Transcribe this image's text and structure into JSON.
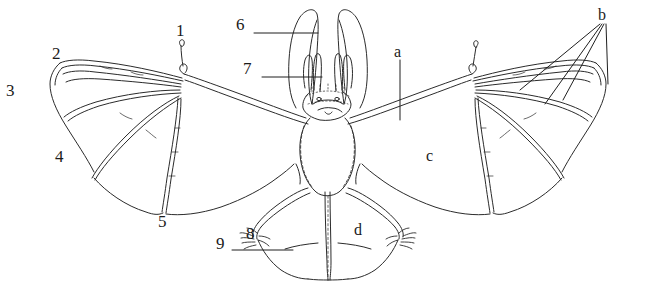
{
  "figure": {
    "background_color": "#ffffff",
    "ink_color": "#2b2b2b",
    "leader_color": "#1f1f1f"
  },
  "labels": {
    "n1": "1",
    "n2": "2",
    "n3": "3",
    "n4": "4",
    "n5": "5",
    "n6": "6",
    "n7": "7",
    "n8": "8",
    "n9": "9",
    "a": "a",
    "b": "b",
    "c": "c",
    "d": "d"
  },
  "label_positions": {
    "n1": {
      "x": 176,
      "y": 22
    },
    "n2": {
      "x": 52,
      "y": 45
    },
    "n3": {
      "x": 6,
      "y": 82
    },
    "n4": {
      "x": 55,
      "y": 148
    },
    "n5": {
      "x": 158,
      "y": 213
    },
    "n6": {
      "x": 236,
      "y": 16
    },
    "n7": {
      "x": 243,
      "y": 60
    },
    "n8": {
      "x": 246,
      "y": 225
    },
    "n9": {
      "x": 216,
      "y": 235
    },
    "a": {
      "x": 394,
      "y": 44
    },
    "b": {
      "x": 598,
      "y": 7
    },
    "c": {
      "x": 426,
      "y": 148
    },
    "d": {
      "x": 354,
      "y": 222
    }
  }
}
